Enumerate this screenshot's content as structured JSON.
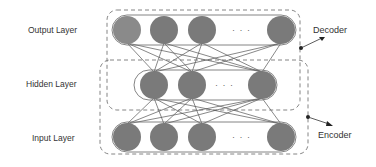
{
  "diagram": {
    "layers": [
      {
        "id": "output",
        "label": "Output Layer",
        "node_count_shown": 4,
        "ellipsis": "· · ·",
        "ellipsis_after": 3
      },
      {
        "id": "hidden",
        "label": "Hidden Layer",
        "node_count_shown": 3,
        "ellipsis": "· · ·",
        "ellipsis_after": 2
      },
      {
        "id": "input",
        "label": "Input Layer",
        "node_count_shown": 4,
        "ellipsis": "· · ·",
        "ellipsis_after": 3
      }
    ],
    "groups": [
      {
        "id": "decoder",
        "label": "Decoder",
        "spans": [
          "hidden",
          "output"
        ]
      },
      {
        "id": "encoder",
        "label": "Encoder",
        "spans": [
          "input",
          "hidden"
        ]
      }
    ],
    "connections": "fully-connected between adjacent layers",
    "colors": {
      "node_fill": "#7a7a7a",
      "node_fill_first_output": "#8a8a8a",
      "edge": "#555555",
      "dashed_box": "#777777",
      "layer_box": "#666666",
      "text": "#333333"
    }
  }
}
